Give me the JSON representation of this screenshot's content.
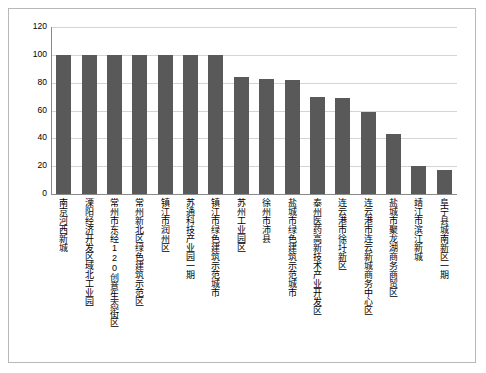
{
  "chart_data": {
    "type": "bar",
    "title": "",
    "subtitle": "",
    "xlabel": "",
    "ylabel": "",
    "ylim": [
      0,
      120
    ],
    "yticks": [
      0,
      20,
      40,
      60,
      80,
      100,
      120
    ],
    "grid": true,
    "legend": false,
    "bar_color": "#595959",
    "categories": [
      "南京河西新城",
      "溧阳经济开发区域北工业园",
      "常州市东经120创意生态街区",
      "常州新北区绿色建筑示范区",
      "镇江市润州区",
      "苏通科技产业园一期",
      "镇江市绿色建筑示范城市",
      "苏州工业园区",
      "徐州市沛县",
      "盐城市绿色建筑示范城市",
      "泰州医药高新技术产业开发区",
      "连云港市徐圩新区",
      "连云港市连云新城商务中心区",
      "盐城市聚龙湖商务商贸区",
      "靖江市滨江新城",
      "阜宁县城南新区一期"
    ],
    "values": [
      100,
      100,
      100,
      100,
      100,
      100,
      100,
      84,
      83,
      82,
      70,
      69,
      59,
      43,
      20,
      17
    ]
  }
}
